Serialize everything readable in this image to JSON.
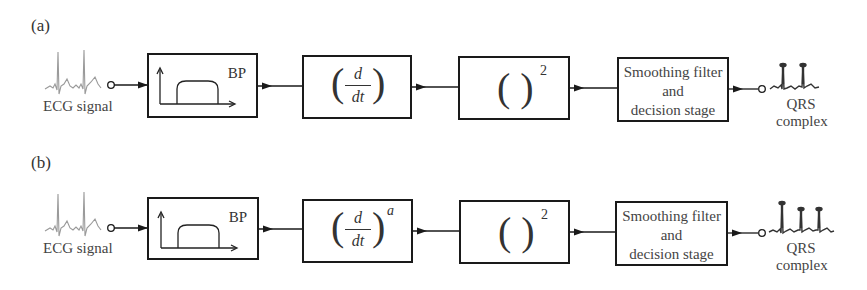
{
  "figure": {
    "panels": [
      {
        "label": "(a)",
        "input_label": "ECG signal",
        "blocks": [
          {
            "id": "bandpass",
            "label": "BP",
            "icon": "bandpass-response-icon"
          },
          {
            "id": "derivative",
            "numerator": "d",
            "denominator": "dt",
            "exponent": ""
          },
          {
            "id": "squaring",
            "expression": "( )",
            "exponent": "2"
          },
          {
            "id": "smoothing",
            "lines": [
              "Smoothing filter",
              "and",
              "decision stage"
            ]
          }
        ],
        "output_label": [
          "QRS",
          "complex"
        ]
      },
      {
        "label": "(b)",
        "input_label": "ECG signal",
        "blocks": [
          {
            "id": "bandpass",
            "label": "BP",
            "icon": "bandpass-response-icon"
          },
          {
            "id": "derivative",
            "numerator": "d",
            "denominator": "dt",
            "exponent": "a"
          },
          {
            "id": "squaring",
            "expression": "( )",
            "exponent": "2"
          },
          {
            "id": "smoothing",
            "lines": [
              "Smoothing filter",
              "and",
              "decision stage"
            ]
          }
        ],
        "output_label": [
          "QRS",
          "complex"
        ]
      }
    ],
    "colors": {
      "line": "#1a1a1a",
      "text": "#333333",
      "ecg_trace": "#9a9a9a"
    }
  }
}
